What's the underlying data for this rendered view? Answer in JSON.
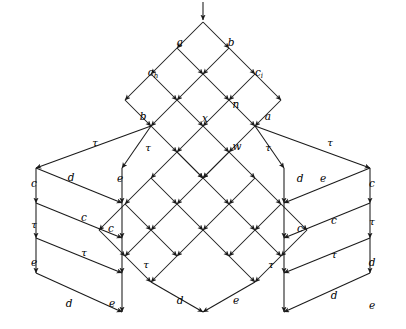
{
  "diagram": {
    "stroke_color": "#1a1a1a",
    "background_color": "#ffffff",
    "entry_arrow": {
      "name": "entry-arrow",
      "x": 203,
      "y": 2,
      "x2": 203,
      "y2": 20
    },
    "labels": [
      {
        "id": "a-top",
        "text": "a",
        "sub": "",
        "x": 180,
        "y": 42
      },
      {
        "id": "b-top",
        "text": "b",
        "sub": "",
        "x": 231,
        "y": 42
      },
      {
        "id": "c-h",
        "text": "c",
        "sub": "h",
        "x": 153,
        "y": 72
      },
      {
        "id": "c-i",
        "text": "c",
        "sub": "i",
        "x": 259,
        "y": 72
      },
      {
        "id": "n-mid",
        "text": "n",
        "sub": "",
        "x": 236,
        "y": 104
      },
      {
        "id": "b-left",
        "text": "b",
        "sub": "",
        "x": 143,
        "y": 116
      },
      {
        "id": "a-right",
        "text": "a",
        "sub": "",
        "x": 268,
        "y": 116
      },
      {
        "id": "x-center",
        "text": "x",
        "sub": "",
        "x": 205,
        "y": 118
      },
      {
        "id": "w-center",
        "text": "w",
        "sub": "",
        "x": 237,
        "y": 146
      },
      {
        "id": "tau-far-left",
        "text": "τ",
        "sub": "",
        "x": 95,
        "y": 143
      },
      {
        "id": "tau-near-left",
        "text": "τ",
        "sub": "",
        "x": 148,
        "y": 148
      },
      {
        "id": "tau-near-right",
        "text": "τ",
        "sub": "",
        "x": 268,
        "y": 148
      },
      {
        "id": "tau-far-right",
        "text": "τ",
        "sub": "",
        "x": 330,
        "y": 143
      },
      {
        "id": "L-left-c",
        "text": "c",
        "sub": "",
        "x": 34,
        "y": 183
      },
      {
        "id": "L-left-tau",
        "text": "τ",
        "sub": "",
        "x": 34,
        "y": 225
      },
      {
        "id": "L-left-e",
        "text": "e",
        "sub": "",
        "x": 34,
        "y": 262
      },
      {
        "id": "L-right-d",
        "text": "d",
        "sub": "",
        "x": 71,
        "y": 177
      },
      {
        "id": "L-right-c",
        "text": "c",
        "sub": "",
        "x": 84,
        "y": 217
      },
      {
        "id": "L-right-tau",
        "text": "τ",
        "sub": "",
        "x": 84,
        "y": 253
      },
      {
        "id": "L-bot-d",
        "text": "d",
        "sub": "",
        "x": 69,
        "y": 303
      },
      {
        "id": "L-bot-e",
        "text": "e",
        "sub": "",
        "x": 112,
        "y": 303
      },
      {
        "id": "C-left-e",
        "text": "e",
        "sub": "",
        "x": 120,
        "y": 178
      },
      {
        "id": "C-left-c",
        "text": "c",
        "sub": "",
        "x": 111,
        "y": 228
      },
      {
        "id": "C-left-tau",
        "text": "τ",
        "sub": "",
        "x": 146,
        "y": 265
      },
      {
        "id": "C-right-d",
        "text": "d",
        "sub": "",
        "x": 300,
        "y": 178
      },
      {
        "id": "C-right-c",
        "text": "c",
        "sub": "",
        "x": 300,
        "y": 228
      },
      {
        "id": "C-right-tau",
        "text": "τ",
        "sub": "",
        "x": 271,
        "y": 265
      },
      {
        "id": "C-bot-d",
        "text": "d",
        "sub": "",
        "x": 180,
        "y": 300
      },
      {
        "id": "C-bot-e",
        "text": "e",
        "sub": "",
        "x": 236,
        "y": 300
      },
      {
        "id": "R-left-e",
        "text": "e",
        "sub": "",
        "x": 323,
        "y": 178
      },
      {
        "id": "R-left-c",
        "text": "c",
        "sub": "",
        "x": 334,
        "y": 220
      },
      {
        "id": "R-left-tau",
        "text": "τ",
        "sub": "",
        "x": 334,
        "y": 255
      },
      {
        "id": "R-left-d",
        "text": "d",
        "sub": "",
        "x": 334,
        "y": 295
      },
      {
        "id": "R-right-c",
        "text": "c",
        "sub": "",
        "x": 372,
        "y": 183
      },
      {
        "id": "R-right-tau",
        "text": "τ",
        "sub": "",
        "x": 372,
        "y": 222
      },
      {
        "id": "R-right-d",
        "text": "d",
        "sub": "",
        "x": 372,
        "y": 262
      },
      {
        "id": "R-bot-e",
        "text": "e",
        "sub": "",
        "x": 372,
        "y": 305
      }
    ],
    "top_lattice": {
      "name": "top-diamond-lattice",
      "apex": {
        "x": 203,
        "y": 22
      },
      "step_x": 26,
      "step_y": 26,
      "rows": 4
    },
    "edges_top": [
      [
        203,
        22,
        177,
        48
      ],
      [
        203,
        22,
        229,
        48
      ],
      [
        177,
        48,
        151,
        74
      ],
      [
        177,
        48,
        203,
        74
      ],
      [
        229,
        48,
        203,
        74
      ],
      [
        229,
        48,
        255,
        74
      ],
      [
        151,
        74,
        125,
        100
      ],
      [
        151,
        74,
        177,
        100
      ],
      [
        203,
        74,
        177,
        100
      ],
      [
        203,
        74,
        229,
        100
      ],
      [
        255,
        74,
        229,
        100
      ],
      [
        255,
        74,
        281,
        100
      ],
      [
        125,
        100,
        151,
        126
      ],
      [
        177,
        100,
        151,
        126
      ],
      [
        177,
        100,
        203,
        126
      ],
      [
        229,
        100,
        203,
        126
      ],
      [
        229,
        100,
        255,
        126
      ],
      [
        281,
        100,
        255,
        126
      ],
      [
        151,
        126,
        177,
        152
      ],
      [
        203,
        126,
        177,
        152
      ],
      [
        203,
        126,
        229,
        152
      ],
      [
        255,
        126,
        229,
        152
      ],
      [
        177,
        152,
        203,
        178
      ],
      [
        229,
        152,
        203,
        178
      ]
    ],
    "fanout_edges": [
      [
        151,
        126,
        36,
        168
      ],
      [
        151,
        126,
        122,
        168
      ],
      [
        255,
        126,
        284,
        168
      ],
      [
        255,
        126,
        370,
        168
      ]
    ],
    "left_ladder": {
      "name": "left-ladder",
      "left_x": 36,
      "right_x": 122,
      "ys": [
        168,
        203,
        238,
        273
      ],
      "bottom": {
        "x": 122,
        "y": 312
      },
      "bottom_left_start": {
        "x": 36,
        "y": 273
      }
    },
    "right_ladder": {
      "name": "right-ladder",
      "left_x": 284,
      "right_x": 370,
      "ys": [
        168,
        203,
        238,
        273
      ],
      "bottom": {
        "x": 284,
        "y": 312
      },
      "bottom_right_start": {
        "x": 370,
        "y": 273
      }
    },
    "center_lattice": {
      "name": "center-diamond-lattice",
      "apex_left": {
        "x": 177,
        "y": 152
      },
      "apex_right": {
        "x": 229,
        "y": 152
      },
      "bottom": {
        "x": 208,
        "y": 312
      },
      "step": 26
    },
    "edges_center": [
      [
        177,
        152,
        151,
        178
      ],
      [
        177,
        152,
        203,
        178
      ],
      [
        229,
        152,
        203,
        178
      ],
      [
        229,
        152,
        255,
        178
      ],
      [
        151,
        178,
        125,
        204
      ],
      [
        151,
        178,
        177,
        204
      ],
      [
        203,
        178,
        177,
        204
      ],
      [
        203,
        178,
        229,
        204
      ],
      [
        255,
        178,
        229,
        204
      ],
      [
        255,
        178,
        281,
        204
      ],
      [
        125,
        204,
        99,
        230
      ],
      [
        125,
        204,
        151,
        230
      ],
      [
        177,
        204,
        151,
        230
      ],
      [
        177,
        204,
        203,
        230
      ],
      [
        229,
        204,
        203,
        230
      ],
      [
        229,
        204,
        255,
        230
      ],
      [
        281,
        204,
        255,
        230
      ],
      [
        281,
        204,
        307,
        230
      ],
      [
        99,
        230,
        125,
        256
      ],
      [
        151,
        230,
        125,
        256
      ],
      [
        151,
        230,
        177,
        256
      ],
      [
        203,
        230,
        177,
        256
      ],
      [
        203,
        230,
        229,
        256
      ],
      [
        255,
        230,
        229,
        256
      ],
      [
        255,
        230,
        281,
        256
      ],
      [
        307,
        230,
        281,
        256
      ],
      [
        125,
        256,
        151,
        282
      ],
      [
        177,
        256,
        151,
        282
      ],
      [
        229,
        256,
        255,
        282
      ],
      [
        281,
        256,
        255,
        282
      ],
      [
        151,
        282,
        203,
        312
      ],
      [
        255,
        282,
        203,
        312
      ]
    ]
  }
}
